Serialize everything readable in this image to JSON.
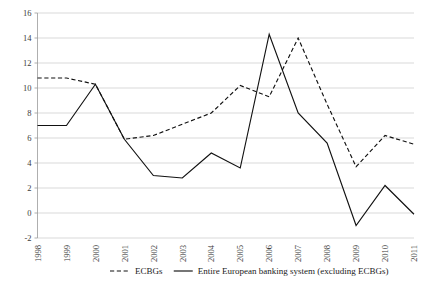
{
  "chart_data": {
    "type": "line",
    "title": "",
    "subtitle": "",
    "xlabel": "",
    "ylabel": "",
    "categories": [
      "1998",
      "1999",
      "2000",
      "2001",
      "2002",
      "2003",
      "2004",
      "2005",
      "2006",
      "2007",
      "2008",
      "2009",
      "2010",
      "2011"
    ],
    "x": [
      1998,
      1999,
      2000,
      2001,
      2002,
      2003,
      2004,
      2005,
      2006,
      2007,
      2008,
      2009,
      2010,
      2011
    ],
    "ylim": [
      -2,
      16
    ],
    "ytick_step": 2,
    "yticks": [
      -2,
      0,
      2,
      4,
      6,
      8,
      10,
      12,
      14,
      16
    ],
    "ytick_labels": [
      "-2",
      "0",
      "2",
      "4",
      "6",
      "8",
      "10",
      "12",
      "14",
      "16"
    ],
    "grid": true,
    "grid_axis": "y",
    "legend_position": "bottom",
    "series": [
      {
        "name": "ECBGs",
        "style": "dashed",
        "color": "#111111",
        "values": [
          10.8,
          10.8,
          10.3,
          5.9,
          6.2,
          7.1,
          8.0,
          10.2,
          9.3,
          14.0,
          8.7,
          3.7,
          6.2,
          5.5
        ]
      },
      {
        "name": "Entire European banking system (excluding ECBGs)",
        "style": "solid",
        "color": "#111111",
        "values": [
          7.0,
          7.0,
          10.3,
          5.9,
          3.0,
          2.8,
          4.8,
          3.6,
          14.3,
          8.0,
          5.6,
          -1.0,
          2.2,
          -0.1
        ]
      }
    ],
    "legend": [
      {
        "label": "ECBGs",
        "style": "dashed"
      },
      {
        "label": "Entire European banking system (excluding ECBGs)",
        "style": "solid"
      }
    ]
  }
}
